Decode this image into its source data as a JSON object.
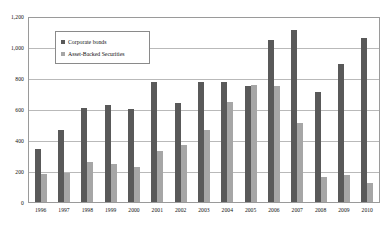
{
  "chart_data": {
    "type": "bar",
    "title": "",
    "xlabel": "",
    "ylabel": "",
    "ylim": [
      0,
      1200
    ],
    "ytick_step": 200,
    "grid": true,
    "legend_position": "upper-left-inside",
    "categories": [
      "1996",
      "1997",
      "1998",
      "1999",
      "2000",
      "2001",
      "2002",
      "2003",
      "2004",
      "2005",
      "2006",
      "2007",
      "2008",
      "2009",
      "2010"
    ],
    "ytick_labels": [
      "1,200",
      "1,000",
      "800",
      "600",
      "400",
      "200",
      "0"
    ],
    "ytick_values": [
      1200,
      1000,
      800,
      600,
      400,
      200,
      0
    ],
    "series": [
      {
        "name": "Corporate bonds",
        "color": "#595959",
        "values": [
          345,
          470,
          615,
          630,
          605,
          780,
          645,
          780,
          780,
          755,
          1055,
          1125,
          715,
          900,
          1070
        ]
      },
      {
        "name": "Asset-Backed Securities",
        "color": "#a6a6a6",
        "values": [
          180,
          190,
          260,
          245,
          230,
          335,
          375,
          470,
          655,
          760,
          755,
          515,
          165,
          175,
          125
        ]
      }
    ]
  },
  "colors": {
    "corporate_bonds": "#595959",
    "asset_backed_securities": "#a6a6a6",
    "gridline": "#b9b9b9",
    "axis": "#9a9a9a",
    "background": "#ffffff"
  }
}
